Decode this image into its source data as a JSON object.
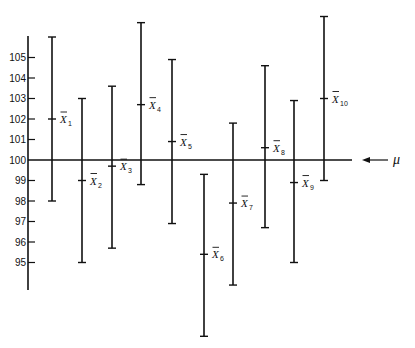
{
  "chart_data": {
    "type": "errorbar",
    "title": "",
    "xlabel": "",
    "ylabel": "",
    "ylim": [
      93,
      107
    ],
    "grid": false,
    "y_ticks": [
      95,
      96,
      97,
      98,
      99,
      100,
      101,
      102,
      103,
      104,
      105
    ],
    "reference_line": {
      "value": 100,
      "label": "μ",
      "annotation": "arrow pointing to line"
    },
    "series": [
      {
        "name": "X̄1",
        "label": "X",
        "sub": "1",
        "mean": 102.0,
        "lower": 98.0,
        "upper": 106.0
      },
      {
        "name": "X̄2",
        "label": "X",
        "sub": "2",
        "mean": 99.0,
        "lower": 95.0,
        "upper": 103.0
      },
      {
        "name": "X̄3",
        "label": "X",
        "sub": "3",
        "mean": 99.7,
        "lower": 95.7,
        "upper": 103.6
      },
      {
        "name": "X̄4",
        "label": "X",
        "sub": "4",
        "mean": 102.7,
        "lower": 98.8,
        "upper": 106.7
      },
      {
        "name": "X̄5",
        "label": "X",
        "sub": "5",
        "mean": 100.9,
        "lower": 96.9,
        "upper": 104.9
      },
      {
        "name": "X̄6",
        "label": "X",
        "sub": "6",
        "mean": 95.4,
        "lower": 91.4,
        "upper": 99.3
      },
      {
        "name": "X̄7",
        "label": "X",
        "sub": "7",
        "mean": 97.9,
        "lower": 93.9,
        "upper": 101.8
      },
      {
        "name": "X̄8",
        "label": "X",
        "sub": "8",
        "mean": 100.6,
        "lower": 96.7,
        "upper": 104.6
      },
      {
        "name": "X̄9",
        "label": "X",
        "sub": "9",
        "mean": 98.9,
        "lower": 95.0,
        "upper": 102.9
      },
      {
        "name": "X̄10",
        "label": "X",
        "sub": "10",
        "mean": 103.0,
        "lower": 99.0,
        "upper": 107.0
      }
    ]
  },
  "layout": {
    "y100_px": 160,
    "px_per_unit": 20.5,
    "axis_x": 28,
    "axis_top": 36,
    "axis_bottom": 290,
    "ref_line_x_end": 352,
    "bar_x": [
      52,
      82,
      112,
      141,
      172,
      204,
      233,
      265,
      294,
      324
    ],
    "color": "#111111"
  }
}
